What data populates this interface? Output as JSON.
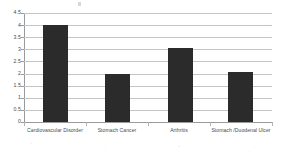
{
  "chart_data": {
    "type": "bar",
    "title": "",
    "xlabel": "",
    "ylabel": "",
    "categories": [
      "Cardiovascular Disorder",
      "Stomach Cancer",
      "Arthritis",
      "Stomach /Duodenal Ulcer"
    ],
    "values": [
      4,
      2,
      3.05,
      2.05
    ],
    "ylim": [
      0,
      4.5
    ],
    "ytick_labels": [
      "0",
      "0.5",
      "1",
      "1.5",
      "2",
      "2.5",
      "3",
      "3.5",
      "4",
      "4.5"
    ],
    "ytick_values": [
      0,
      0.5,
      1,
      1.5,
      2,
      2.5,
      3,
      3.5,
      4,
      4.5
    ],
    "grid": true,
    "legend": "none",
    "bar_color": "#2b2b2b",
    "gridline_color": "#c4c4c4",
    "axis_color": "#9a9a9a",
    "background": "#ffffff"
  }
}
